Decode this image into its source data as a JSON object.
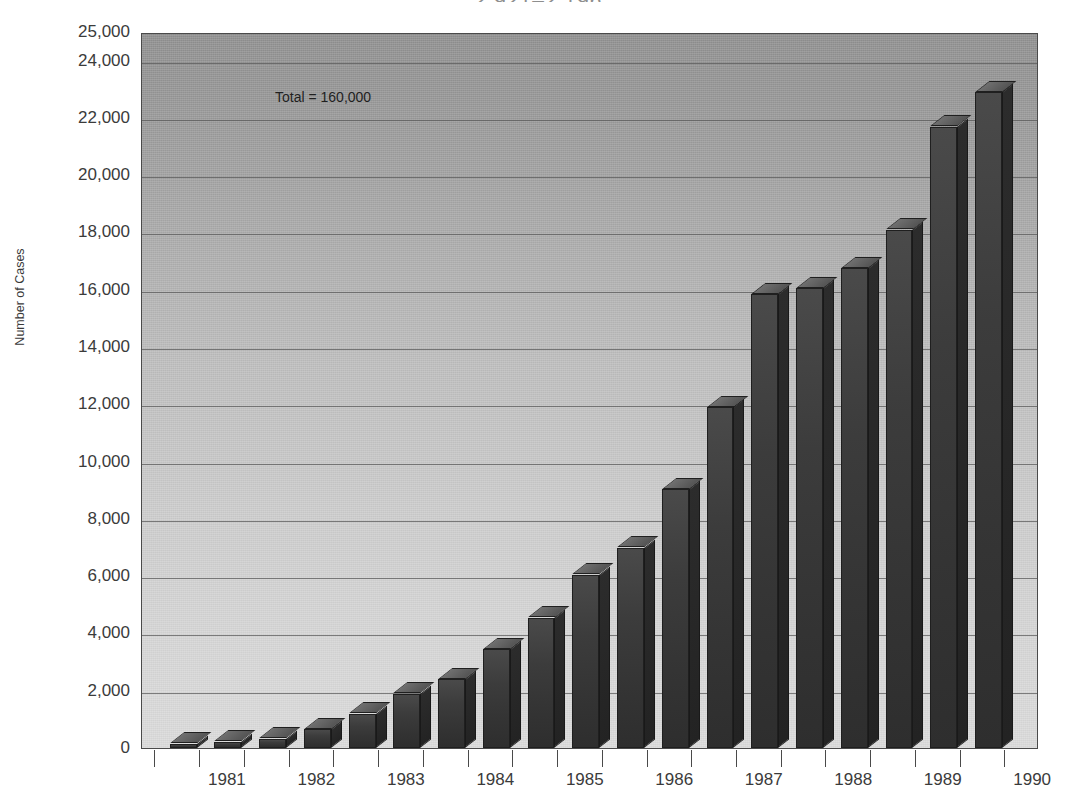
{
  "title": "2,921–2,196",
  "axis": {
    "y_title": "Number of Cases",
    "y_ticks": [
      "25,000",
      "24,000",
      "22,000",
      "20,000",
      "18,000",
      "16,000",
      "14,000",
      "12,000",
      "10,000",
      "8,000",
      "6,000",
      "4,000",
      "2,000",
      "0"
    ],
    "x_labels": [
      "1981",
      "1982",
      "1983",
      "1984",
      "1985",
      "1986",
      "1987",
      "1988",
      "1989",
      "1990"
    ]
  },
  "annotation": "Total = 160,000",
  "colors": {
    "bar_face": "#3a3a3a",
    "bar_top": "#5f5f5f",
    "bar_side": "#272727",
    "grid": "#595959",
    "frame": "#4a4a4a",
    "text": "#3b3b3b"
  },
  "chart_data": {
    "type": "bar",
    "title": "2,921–2,196",
    "xlabel": "",
    "ylabel": "Number of Cases",
    "ylim": [
      0,
      25000
    ],
    "yticks": [
      0,
      2000,
      4000,
      6000,
      8000,
      10000,
      12000,
      14000,
      16000,
      18000,
      20000,
      22000,
      24000,
      25000
    ],
    "grid": true,
    "legend": "none",
    "annotations": [
      "Total = 160,000"
    ],
    "categories": [
      "1981 H1",
      "1981 H2",
      "1982 H1",
      "1982 H2",
      "1983 H1",
      "1983 H2",
      "1984 H1",
      "1984 H2",
      "1985 H1",
      "1985 H2",
      "1986 H1",
      "1986 H2",
      "1987 H1",
      "1987 H2",
      "1988 H1",
      "1988 H2",
      "1989 H1",
      "1989 H2",
      "1990 H1",
      "1990 H2"
    ],
    "x_group_labels": [
      "1981",
      "1982",
      "1983",
      "1984",
      "1985",
      "1986",
      "1987",
      "1988",
      "1989",
      "1990"
    ],
    "values": [
      150,
      220,
      330,
      650,
      1200,
      1900,
      2400,
      3450,
      4550,
      6050,
      7000,
      9050,
      11900,
      15850,
      16050,
      16750,
      18100,
      21700,
      22900,
      22900
    ],
    "values_plotted": [
      150,
      220,
      330,
      650,
      1200,
      1900,
      2400,
      3450,
      4550,
      6050,
      7000,
      9050,
      11900,
      15850,
      16050,
      16750,
      18100,
      21700,
      22900
    ],
    "total": 160000
  }
}
